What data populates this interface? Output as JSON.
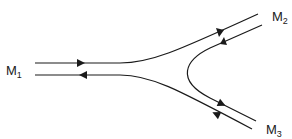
{
  "diagram": {
    "title": "",
    "nodes": [
      {
        "id": "M1",
        "label": "M",
        "sub": "1"
      },
      {
        "id": "M2",
        "label": "M",
        "sub": "2"
      },
      {
        "id": "M3",
        "label": "M",
        "sub": "3"
      }
    ],
    "edges": [
      {
        "from": "M1",
        "to": "M2",
        "direction": "forward"
      },
      {
        "from": "M2",
        "to": "M3",
        "direction": "forward"
      },
      {
        "from": "M3",
        "to": "M1",
        "direction": "forward"
      }
    ],
    "colors": {
      "stroke": "#1a1a1a",
      "background": "#ffffff"
    }
  }
}
